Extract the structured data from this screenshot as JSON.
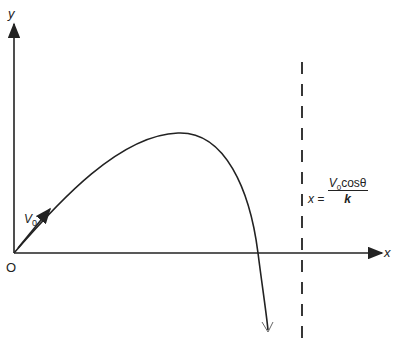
{
  "diagram": {
    "axes": {
      "x_label": "x",
      "y_label": "y",
      "origin_label": "O"
    },
    "velocity_label": {
      "symbol": "V",
      "subscript": "0"
    },
    "asymptote": {
      "lhs": "x =",
      "numerator_symbol": "V",
      "numerator_subscript": "0",
      "numerator_rest": "cosθ",
      "denominator": "k"
    },
    "line_color": "#222222"
  }
}
